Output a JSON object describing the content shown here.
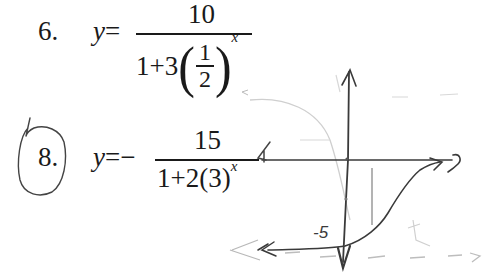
{
  "document": {
    "type": "scanned worksheet",
    "colors": {
      "ink_print": "#1a1a1a",
      "ink_pencil_dark": "#333333",
      "ink_pencil_faint": "#c8c8c8",
      "paper": "#ffffff"
    }
  },
  "problems": [
    {
      "number": "6.",
      "circled": false,
      "lhs": "y",
      "equals": "=",
      "sign": "",
      "numerator": "10",
      "denominator": {
        "prefix": "1+3",
        "base_fraction": {
          "top": "1",
          "bottom": "2"
        },
        "exponent": "x"
      },
      "plain_text": "y = 10 / (1 + 3(1/2)^x)"
    },
    {
      "number": "8.",
      "circled": true,
      "lhs": "y",
      "equals": "=",
      "sign": "−",
      "numerator": "15",
      "denominator": {
        "prefix": "1+2(3)",
        "exponent": "x"
      },
      "plain_text": "y = −15 / (1 + 2(3)^x)"
    }
  ],
  "sketch": {
    "description": "hand-drawn graph of problem 8: decreasing logistic curve with asymptotes y=0 and y=-15",
    "y_intercept_label": "-5",
    "annotations": {
      "x_axis_end_mark": "0",
      "left_mark": "4"
    }
  }
}
